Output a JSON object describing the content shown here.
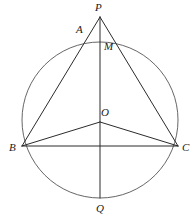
{
  "figure": {
    "type": "euclidean-geometry-diagram",
    "width": 195,
    "height": 220,
    "background_color": "#ffffff",
    "stroke_color": "#2b2b2b",
    "circle_stroke_color": "#555555",
    "label_color": "#1a1a1a"
  },
  "circle": {
    "name": "circumcircle",
    "center_x": 100,
    "center_y": 120,
    "radius": 78,
    "stroke_width": 0.9
  },
  "points": {
    "P": {
      "label": "P",
      "x": 100,
      "y": 17,
      "label_x": 95,
      "label_y": 2
    },
    "A": {
      "label": "A",
      "x": 87,
      "y": 39,
      "label_x": 76,
      "label_y": 24
    },
    "M": {
      "label": "M",
      "x": 100,
      "y": 44,
      "label_x": 104,
      "label_y": 41
    },
    "O": {
      "label": "O",
      "x": 100,
      "y": 122,
      "label_x": 101,
      "label_y": 107
    },
    "B": {
      "label": "B",
      "x": 22,
      "y": 146,
      "label_x": 9,
      "label_y": 142
    },
    "C": {
      "label": "C",
      "x": 178,
      "y": 146,
      "label_x": 182,
      "label_y": 142
    },
    "Q": {
      "label": "Q",
      "x": 100,
      "y": 198,
      "label_x": 96,
      "label_y": 203
    }
  },
  "segments": [
    {
      "name": "segment-PQ",
      "from": "P",
      "to": "Q",
      "stroke_width": 1.0
    },
    {
      "name": "segment-PB",
      "from": "P",
      "to": "B",
      "stroke_width": 1.0
    },
    {
      "name": "segment-PC",
      "from": "P",
      "to": "C",
      "stroke_width": 1.0
    },
    {
      "name": "segment-BC",
      "from": "B",
      "to": "C",
      "stroke_width": 1.0
    },
    {
      "name": "segment-BO",
      "from": "B",
      "to": "O",
      "stroke_width": 1.0
    },
    {
      "name": "segment-OC",
      "from": "O",
      "to": "C",
      "stroke_width": 1.0
    }
  ]
}
